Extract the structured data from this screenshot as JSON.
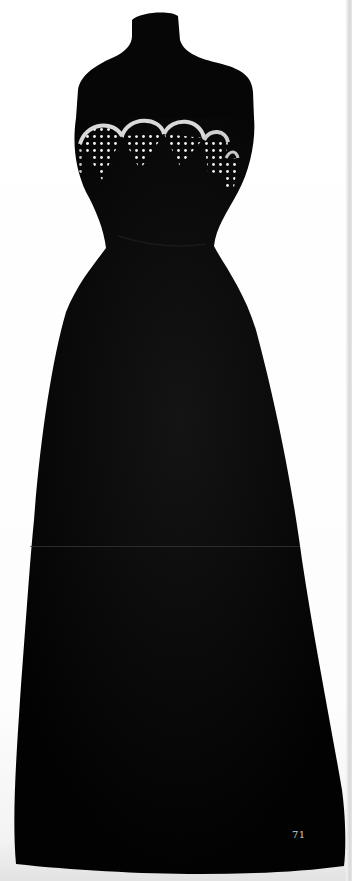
{
  "page": {
    "number": "71"
  },
  "colors": {
    "background": "#ffffff",
    "gown": "#050505",
    "beading": "#e8e8e8",
    "page_number": "#cfcfcf",
    "gutter": "#d8d8d8"
  }
}
